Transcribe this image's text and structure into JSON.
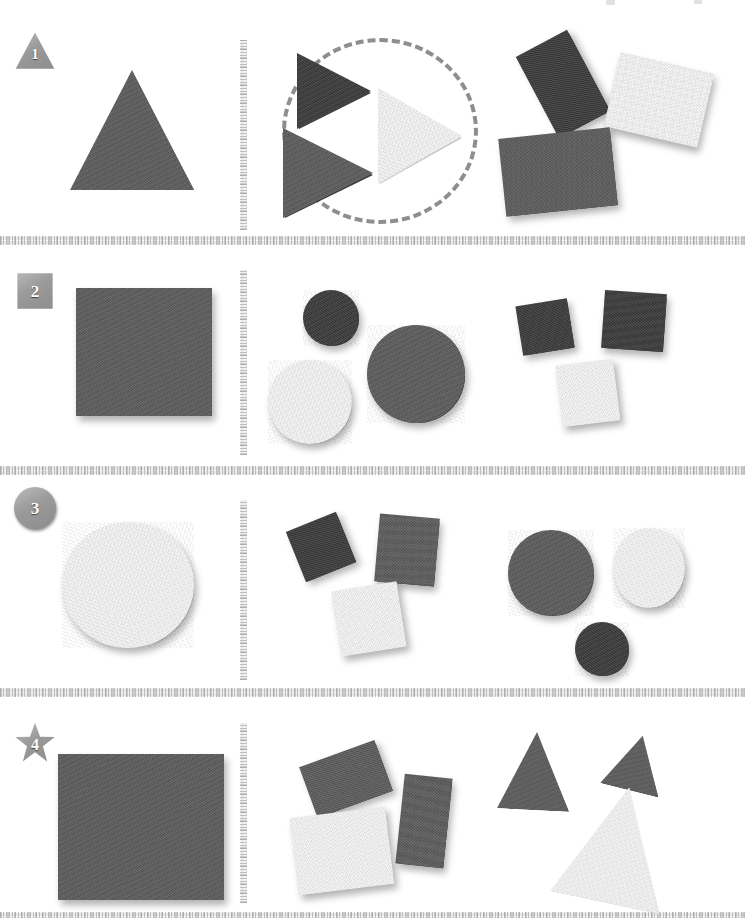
{
  "page": {
    "background_color": "#ffffff",
    "width": 745,
    "height": 918
  },
  "palette": {
    "dark": "#3b3b3b",
    "medium": "#5b5b5b",
    "light": "#f0f0f0",
    "marker_gray": "#9a9a9a",
    "dashed_circle": "#8e8e8e",
    "rule_gray": "#e9e9e9"
  },
  "scan_artifacts": [
    {
      "x": 606,
      "y": 0,
      "w": 9,
      "h": 5
    },
    {
      "x": 694,
      "y": 0,
      "w": 8,
      "h": 4
    }
  ],
  "horizontal_rules": [
    {
      "y": 236
    },
    {
      "y": 466
    },
    {
      "y": 688
    },
    {
      "y": 912
    }
  ],
  "rows": [
    {
      "marker": {
        "label": "1",
        "shape": "triangle",
        "x": 14,
        "y": 30
      },
      "divider": {
        "x": 240,
        "y": 40,
        "h": 190
      },
      "reference": {
        "name": "triangle",
        "kind": "triangle",
        "tone": "medium",
        "x": 70,
        "y": 70,
        "w": 124,
        "h": 120,
        "rotate": 0
      },
      "group_a": {
        "grouped": true,
        "ellipse": {
          "x": 282,
          "y": 38,
          "w": 196,
          "h": 186
        },
        "shapes": [
          {
            "name": "triangle-dark",
            "kind": "triangle",
            "orient": "right",
            "tone": "dark",
            "x": 297,
            "y": 53,
            "w": 74,
            "h": 76,
            "rotate": 0
          },
          {
            "name": "triangle-light",
            "kind": "triangle",
            "orient": "right",
            "tone": "light",
            "x": 378,
            "y": 88,
            "w": 84,
            "h": 96,
            "rotate": 0
          },
          {
            "name": "triangle-medium",
            "kind": "triangle",
            "orient": "right",
            "tone": "medium",
            "x": 283,
            "y": 128,
            "w": 90,
            "h": 90,
            "rotate": 0
          }
        ]
      },
      "group_b": {
        "grouped": false,
        "shapes": [
          {
            "name": "rect-dark",
            "kind": "rect",
            "tone": "dark",
            "x": 534,
            "y": 38,
            "w": 58,
            "h": 92,
            "rotate": -28
          },
          {
            "name": "rect-light",
            "kind": "rect",
            "tone": "light",
            "x": 611,
            "y": 62,
            "w": 96,
            "h": 76,
            "rotate": 13
          },
          {
            "name": "rect-medium",
            "kind": "rect",
            "tone": "medium",
            "x": 502,
            "y": 133,
            "w": 112,
            "h": 78,
            "rotate": -6
          }
        ]
      }
    },
    {
      "marker": {
        "label": "2",
        "shape": "square",
        "x": 14,
        "y": 270
      },
      "divider": {
        "x": 240,
        "y": 270,
        "h": 185
      },
      "reference": {
        "name": "square",
        "kind": "rect",
        "tone": "medium",
        "x": 76,
        "y": 288,
        "w": 136,
        "h": 128,
        "rotate": 0
      },
      "group_a": {
        "grouped": false,
        "shapes": [
          {
            "name": "circle-dark-small",
            "kind": "circle",
            "tone": "dark",
            "x": 303,
            "y": 290,
            "w": 56,
            "h": 56
          },
          {
            "name": "circle-light",
            "kind": "circle",
            "tone": "light",
            "x": 268,
            "y": 360,
            "w": 84,
            "h": 84
          },
          {
            "name": "circle-dark-large",
            "kind": "circle",
            "tone": "medium",
            "x": 367,
            "y": 325,
            "w": 98,
            "h": 98
          }
        ]
      },
      "group_b": {
        "grouped": false,
        "shapes": [
          {
            "name": "square-dark-small",
            "kind": "rect",
            "tone": "dark",
            "x": 519,
            "y": 302,
            "w": 52,
            "h": 50,
            "rotate": -9
          },
          {
            "name": "square-dark",
            "kind": "rect",
            "tone": "dark",
            "x": 603,
            "y": 292,
            "w": 62,
            "h": 58,
            "rotate": 4
          },
          {
            "name": "square-light",
            "kind": "rect",
            "tone": "light",
            "x": 559,
            "y": 362,
            "w": 58,
            "h": 62,
            "rotate": -7
          }
        ]
      }
    },
    {
      "marker": {
        "label": "3",
        "shape": "circle",
        "x": 14,
        "y": 487
      },
      "divider": {
        "x": 240,
        "y": 500,
        "h": 180
      },
      "reference": {
        "name": "circle",
        "kind": "circle",
        "tone": "light",
        "x": 62,
        "y": 522,
        "w": 132,
        "h": 126
      },
      "group_a": {
        "grouped": false,
        "shapes": [
          {
            "name": "square-dark-rotated",
            "kind": "rect",
            "tone": "dark",
            "x": 294,
            "y": 520,
            "w": 54,
            "h": 54,
            "rotate": -22
          },
          {
            "name": "square-dark",
            "kind": "rect",
            "tone": "medium",
            "x": 377,
            "y": 516,
            "w": 60,
            "h": 68,
            "rotate": 5
          },
          {
            "name": "square-light",
            "kind": "rect",
            "tone": "light",
            "x": 336,
            "y": 586,
            "w": 66,
            "h": 66,
            "rotate": -9
          }
        ]
      },
      "group_b": {
        "grouped": false,
        "shapes": [
          {
            "name": "circle-medium-large",
            "kind": "circle",
            "tone": "medium",
            "x": 508,
            "y": 530,
            "w": 86,
            "h": 86
          },
          {
            "name": "circle-light",
            "kind": "circle",
            "tone": "light",
            "x": 613,
            "y": 528,
            "w": 72,
            "h": 80
          },
          {
            "name": "circle-dark-small",
            "kind": "circle",
            "tone": "dark",
            "x": 575,
            "y": 622,
            "w": 54,
            "h": 54
          }
        ]
      }
    },
    {
      "marker": {
        "label": "4",
        "shape": "star",
        "x": 14,
        "y": 722
      },
      "divider": {
        "x": 240,
        "y": 723,
        "h": 180
      },
      "reference": {
        "name": "rectangle",
        "kind": "rect",
        "tone": "medium",
        "x": 58,
        "y": 754,
        "w": 166,
        "h": 146,
        "rotate": 0
      },
      "group_a": {
        "grouped": false,
        "shapes": [
          {
            "name": "rect-dark",
            "kind": "rect",
            "tone": "medium",
            "x": 306,
            "y": 752,
            "w": 80,
            "h": 54,
            "rotate": -20
          },
          {
            "name": "rect-medium",
            "kind": "rect",
            "tone": "medium",
            "x": 400,
            "y": 776,
            "w": 48,
            "h": 90,
            "rotate": 6
          },
          {
            "name": "rect-light",
            "kind": "rect",
            "tone": "light",
            "x": 294,
            "y": 812,
            "w": 96,
            "h": 78,
            "rotate": -7
          }
        ]
      },
      "group_b": {
        "grouped": false,
        "shapes": [
          {
            "name": "triangle-dark-left",
            "kind": "triangle",
            "orient": "up",
            "tone": "medium",
            "x": 499,
            "y": 732,
            "w": 72,
            "h": 78,
            "rotate": 3
          },
          {
            "name": "triangle-dark-right",
            "kind": "triangle",
            "orient": "up",
            "tone": "medium",
            "x": 606,
            "y": 735,
            "w": 60,
            "h": 56,
            "rotate": 14
          },
          {
            "name": "triangle-light",
            "kind": "triangle",
            "orient": "up",
            "tone": "light",
            "x": 561,
            "y": 786,
            "w": 112,
            "h": 118,
            "rotate": 12
          }
        ]
      }
    }
  ]
}
